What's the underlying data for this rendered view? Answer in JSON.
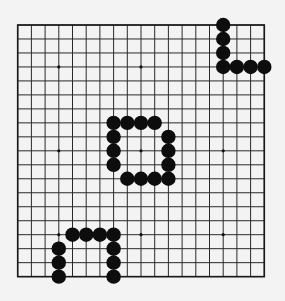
{
  "diagram": {
    "title": "",
    "type": "go-board",
    "board_size": 19,
    "background_color": "#f3f3f3",
    "line_color": "#2a2a2a",
    "stone_color_black": "#0d0d0d",
    "layout": {
      "origin_x": 17.7,
      "origin_y": 25,
      "spacing_x": 13.7,
      "spacing_y": 13.98,
      "stone_radius": 7.2,
      "star_radius": 1.6
    },
    "star_points": [
      [
        3,
        3
      ],
      [
        9,
        3
      ],
      [
        15,
        3
      ],
      [
        3,
        9
      ],
      [
        9,
        9
      ],
      [
        15,
        9
      ],
      [
        3,
        15
      ],
      [
        9,
        15
      ],
      [
        15,
        15
      ]
    ],
    "stones": {
      "black": [
        {
          "group": "top-right",
          "points": [
            [
              15,
              0
            ],
            [
              15,
              1
            ],
            [
              15,
              2
            ],
            [
              15,
              3
            ],
            [
              16,
              3
            ],
            [
              17,
              3
            ],
            [
              18,
              3
            ]
          ]
        },
        {
          "group": "center",
          "points": [
            [
              7,
              7
            ],
            [
              8,
              7
            ],
            [
              9,
              7
            ],
            [
              10,
              7
            ],
            [
              7,
              8
            ],
            [
              7,
              9
            ],
            [
              7,
              10
            ],
            [
              11,
              8
            ],
            [
              11,
              9
            ],
            [
              11,
              10
            ],
            [
              11,
              11
            ],
            [
              8,
              11
            ],
            [
              9,
              11
            ],
            [
              10,
              11
            ]
          ]
        },
        {
          "group": "bottom-left",
          "points": [
            [
              4,
              15
            ],
            [
              5,
              15
            ],
            [
              6,
              15
            ],
            [
              7,
              15
            ],
            [
              3,
              16
            ],
            [
              3,
              17
            ],
            [
              3,
              18
            ],
            [
              7,
              16
            ],
            [
              7,
              17
            ],
            [
              7,
              18
            ]
          ]
        }
      ],
      "white": []
    }
  }
}
